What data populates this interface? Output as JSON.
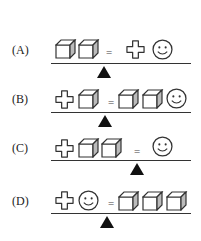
{
  "options": [
    {
      "label": "(A)",
      "left": [
        "cube",
        "cube"
      ],
      "right": [
        "cross",
        "smiley"
      ],
      "fulcrum_x": 104
    },
    {
      "label": "(B)",
      "left": [
        "cross",
        "cube"
      ],
      "right": [
        "cube",
        "cube",
        "smiley"
      ],
      "fulcrum_x": 105
    },
    {
      "label": "(C)",
      "left": [
        "cross",
        "cube",
        "cube"
      ],
      "right": [
        "smiley"
      ],
      "fulcrum_x": 137
    },
    {
      "label": "(D)",
      "left": [
        "cross",
        "smiley"
      ],
      "right": [
        "cube",
        "cube",
        "cube"
      ],
      "fulcrum_x": 107
    }
  ],
  "equals_sign": "="
}
